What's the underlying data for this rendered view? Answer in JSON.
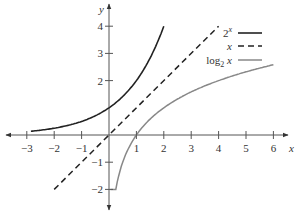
{
  "chart_data": {
    "type": "line",
    "title": "",
    "xlabel": "x",
    "ylabel": "y",
    "xlim": [
      -3.4,
      6.5
    ],
    "ylim": [
      -2.5,
      4.3
    ],
    "x_ticks": [
      -3,
      -2,
      -1,
      1,
      2,
      3,
      4,
      5,
      6
    ],
    "x_tick_labels": [
      "−3",
      "−2",
      "−1",
      "1",
      "2",
      "3",
      "4",
      "5",
      "6"
    ],
    "y_ticks": [
      -2,
      -1,
      2,
      3,
      4
    ],
    "y_tick_labels": [
      "−2",
      "−1",
      "2",
      "3",
      "4"
    ],
    "grid": false,
    "legend_position": "upper right",
    "series": [
      {
        "name": "2^x",
        "legend_label": "2",
        "legend_sup": "x",
        "style": "solid",
        "color": "#222222",
        "x": [
          -2.9,
          -2,
          -1,
          0,
          1,
          1.5,
          2
        ],
        "values": [
          0.134,
          0.25,
          0.5,
          1,
          2,
          2.83,
          4
        ]
      },
      {
        "name": "x",
        "legend_label": "x",
        "style": "dashed",
        "color": "#222222",
        "x": [
          -2,
          4
        ],
        "values": [
          -2,
          4
        ]
      },
      {
        "name": "log2 x",
        "legend_label": "log",
        "legend_sub": "2",
        "legend_suffix": " x",
        "style": "solid",
        "color": "#888888",
        "x": [
          0.25,
          0.5,
          1,
          2,
          3,
          4,
          5,
          6
        ],
        "values": [
          -2,
          -1,
          0,
          1,
          1.585,
          2,
          2.32,
          2.585
        ]
      }
    ]
  }
}
